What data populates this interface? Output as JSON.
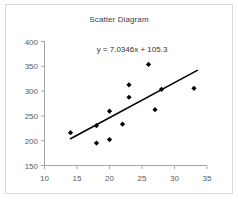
{
  "chart_data": {
    "type": "scatter",
    "title": "Scatter Diagram",
    "xlabel": "",
    "ylabel": "",
    "xlim": [
      10,
      35
    ],
    "ylim": [
      150,
      400
    ],
    "xticks": [
      10,
      15,
      20,
      25,
      30,
      35
    ],
    "yticks": [
      150,
      200,
      250,
      300,
      350,
      400
    ],
    "grid": false,
    "legend": false,
    "annotation": "y = 7.0346x + 105.3",
    "trendline": {
      "slope": 7.0346,
      "intercept": 105.3,
      "x_start": 14,
      "x_end": 33.5,
      "label": "y = 7.0346x + 105.3"
    },
    "points": [
      {
        "x": 14,
        "y": 216
      },
      {
        "x": 18,
        "y": 195
      },
      {
        "x": 18,
        "y": 230
      },
      {
        "x": 20,
        "y": 202
      },
      {
        "x": 20,
        "y": 259
      },
      {
        "x": 22,
        "y": 233
      },
      {
        "x": 23,
        "y": 287
      },
      {
        "x": 23,
        "y": 312
      },
      {
        "x": 26,
        "y": 353
      },
      {
        "x": 27,
        "y": 262
      },
      {
        "x": 28,
        "y": 303
      },
      {
        "x": 33,
        "y": 305
      }
    ],
    "marker": "diamond",
    "marker_color": "#000000",
    "line_color": "#000000",
    "axis_color": "#a6a6a6",
    "background": "#ffffff"
  },
  "ticks": {
    "y": [
      "400",
      "350",
      "300",
      "250",
      "200",
      "150"
    ],
    "x": [
      "10",
      "15",
      "20",
      "25",
      "30",
      "35"
    ]
  }
}
